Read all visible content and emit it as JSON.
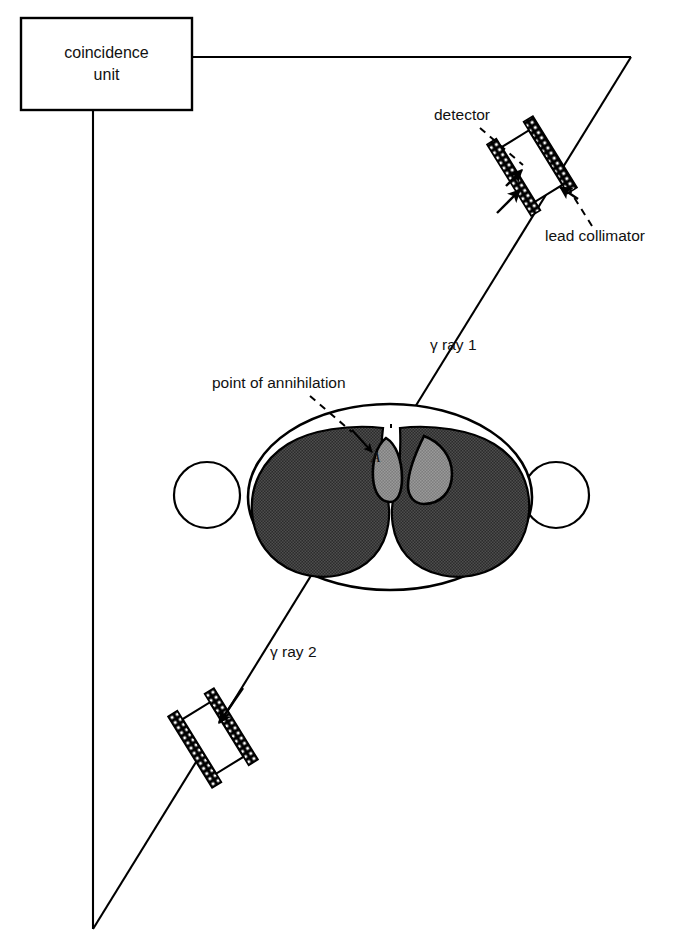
{
  "figure": {
    "title_text": "Positron annihilation coincidence detection diagram",
    "background_color": "#ffffff",
    "stroke_color": "#000000",
    "brain_tissue_color": "#3a3a3a",
    "ventricle_color": "#8a8a8a",
    "skull_fill_color": "#ffffff"
  },
  "coincidence_unit": {
    "label_line1": "coincidence",
    "label_line2": "unit"
  },
  "labels": {
    "detector": "detector",
    "lead_collimator": "lead collimator",
    "point_of_annihilation": "point of annihilation",
    "gamma_ray_1": "γ ray 1",
    "gamma_ray_2": "γ ray 2",
    "annihilation_marker": "A"
  },
  "components": {
    "detector_upper_name": "upper detector assembly",
    "detector_lower_name": "lower detector assembly",
    "head_name": "head cross-section",
    "left_ear_name": "left ear",
    "right_ear_name": "right ear"
  }
}
